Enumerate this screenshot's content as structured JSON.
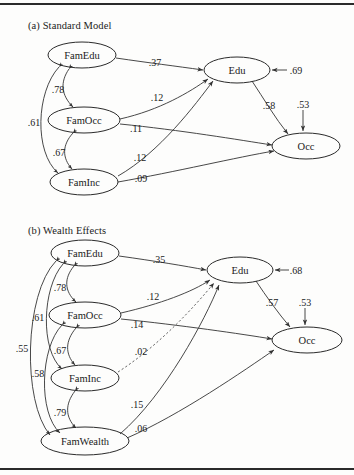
{
  "figure": {
    "panels": [
      {
        "id": "a",
        "title": "(a) Standard Model",
        "nodes": [
          {
            "name": "FamEdu",
            "label": "FamEdu",
            "cx": 82,
            "cy": 55,
            "rx": 34,
            "ry": 13
          },
          {
            "name": "FamOcc",
            "label": "FamOcc",
            "cx": 84,
            "cy": 120,
            "rx": 36,
            "ry": 13
          },
          {
            "name": "FamInc",
            "label": "FamInc",
            "cx": 84,
            "cy": 182,
            "rx": 34,
            "ry": 13
          },
          {
            "name": "Edu",
            "label": "Edu",
            "cx": 237,
            "cy": 70,
            "rx": 33,
            "ry": 13
          },
          {
            "name": "Occ",
            "label": "Occ",
            "cx": 306,
            "cy": 146,
            "rx": 34,
            "ry": 13
          }
        ],
        "paths": [
          {
            "from": "FamEdu",
            "to": "Edu",
            "coef": ".37",
            "lx": 155,
            "ly": 62,
            "style": "solid"
          },
          {
            "from": "FamOcc",
            "to": "Edu",
            "coef": ".12",
            "lx": 157,
            "ly": 97,
            "style": "solid"
          },
          {
            "from": "FamOcc",
            "to": "Occ",
            "coef": ".11",
            "lx": 136,
            "ly": 128,
            "style": "solid"
          },
          {
            "from": "FamInc",
            "to": "Edu",
            "coef": ".12",
            "lx": 140,
            "ly": 157,
            "style": "solid"
          },
          {
            "from": "FamInc",
            "to": "Occ",
            "coef": ".09",
            "lx": 141,
            "ly": 178,
            "style": "solid"
          },
          {
            "from": "Edu",
            "to": "Occ",
            "coef": ".58",
            "lx": 269,
            "ly": 105,
            "style": "solid"
          }
        ],
        "correlations": [
          {
            "between": [
              "FamEdu",
              "FamOcc"
            ],
            "coef": ".78",
            "lx": 58,
            "ly": 89
          },
          {
            "between": [
              "FamOcc",
              "FamInc"
            ],
            "coef": ".67",
            "lx": 59,
            "ly": 152
          },
          {
            "between": [
              "FamEdu",
              "FamInc"
            ],
            "coef": ".61",
            "lx": 34,
            "ly": 122
          }
        ],
        "disturbances": [
          {
            "on": "Edu",
            "coef": ".69",
            "lx": 294,
            "ly": 70
          },
          {
            "on": "Occ",
            "coef": ".53",
            "lx": 303,
            "ly": 104
          }
        ]
      },
      {
        "id": "b",
        "title": "(b) Wealth Effects",
        "nodes": [
          {
            "name": "FamEdu",
            "label": "FamEdu",
            "cx": 85,
            "cy": 253,
            "rx": 34,
            "ry": 13
          },
          {
            "name": "FamOcc",
            "label": "FamOcc",
            "cx": 85,
            "cy": 315,
            "rx": 36,
            "ry": 13
          },
          {
            "name": "FamInc",
            "label": "FamInc",
            "cx": 85,
            "cy": 378,
            "rx": 34,
            "ry": 13
          },
          {
            "name": "FamWealth",
            "label": "FamWealth",
            "cx": 85,
            "cy": 441,
            "rx": 44,
            "ry": 14
          },
          {
            "name": "Edu",
            "label": "Edu",
            "cx": 240,
            "cy": 270,
            "rx": 33,
            "ry": 13
          },
          {
            "name": "Occ",
            "label": "Occ",
            "cx": 307,
            "cy": 340,
            "rx": 35,
            "ry": 13
          }
        ],
        "paths": [
          {
            "from": "FamEdu",
            "to": "Edu",
            "coef": ".35",
            "lx": 159,
            "ly": 259,
            "style": "solid"
          },
          {
            "from": "FamOcc",
            "to": "Edu",
            "coef": ".12",
            "lx": 153,
            "ly": 296,
            "style": "solid"
          },
          {
            "from": "FamOcc",
            "to": "Occ",
            "coef": ".14",
            "lx": 137,
            "ly": 324,
            "style": "solid"
          },
          {
            "from": "FamInc",
            "to": "Edu",
            "coef": ".02",
            "lx": 141,
            "ly": 351,
            "style": "dashed"
          },
          {
            "from": "FamWealth",
            "to": "Edu",
            "coef": ".15",
            "lx": 137,
            "ly": 404,
            "style": "solid"
          },
          {
            "from": "FamWealth",
            "to": "Occ",
            "coef": ".06",
            "lx": 141,
            "ly": 428,
            "style": "solid"
          },
          {
            "from": "Edu",
            "to": "Occ",
            "coef": ".57",
            "lx": 272,
            "ly": 302,
            "style": "solid"
          }
        ],
        "correlations": [
          {
            "between": [
              "FamEdu",
              "FamOcc"
            ],
            "coef": ".78",
            "lx": 60,
            "ly": 287
          },
          {
            "between": [
              "FamOcc",
              "FamInc"
            ],
            "coef": ".67",
            "lx": 60,
            "ly": 350
          },
          {
            "between": [
              "FamInc",
              "FamWealth"
            ],
            "coef": ".79",
            "lx": 60,
            "ly": 412
          },
          {
            "between": [
              "FamEdu",
              "FamInc"
            ],
            "coef": ".61",
            "lx": 38,
            "ly": 317
          },
          {
            "between": [
              "FamOcc",
              "FamWealth"
            ],
            "coef": ".58",
            "lx": 38,
            "ly": 373
          },
          {
            "between": [
              "FamEdu",
              "FamWealth"
            ],
            "coef": ".55",
            "lx": 22,
            "ly": 348
          }
        ],
        "disturbances": [
          {
            "on": "Edu",
            "coef": ".68",
            "lx": 296,
            "ly": 270
          },
          {
            "on": "Occ",
            "coef": ".53",
            "lx": 305,
            "ly": 302
          }
        ]
      }
    ]
  }
}
